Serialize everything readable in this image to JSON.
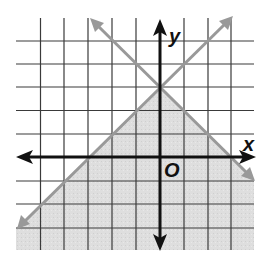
{
  "graph": {
    "type": "system-of-linear-inequalities",
    "axis_labels": {
      "x": "x",
      "y": "y",
      "origin": "O"
    },
    "x_range": [
      -6,
      4
    ],
    "y_range": [
      -4,
      5
    ],
    "grid_spacing": 1,
    "boundary_lines": [
      {
        "equation": "y = x + 3",
        "slope": 1,
        "intercept": 3,
        "style": "solid",
        "color": "#9a9a9a"
      },
      {
        "equation": "y = -x + 3",
        "slope": -1,
        "intercept": 3,
        "style": "solid",
        "color": "#9a9a9a"
      }
    ],
    "intersection": [
      0,
      3
    ],
    "shaded_region": "below both lines (y ≤ x + 3 and y ≤ -x + 3)",
    "colors": {
      "shade": "#dcdcdc",
      "grid": "#333333",
      "axis": "#111111",
      "boundary": "#9a9a9a"
    }
  }
}
